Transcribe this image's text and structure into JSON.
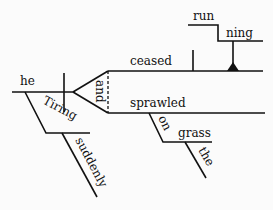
{
  "diagram": {
    "type": "sentence-diagram",
    "sentence": "Tiring suddenly, he ceased running and sprawled on the grass.",
    "words": {
      "subject": "he",
      "participle": "Tiring",
      "participle_modifier": "suddenly",
      "conjunction": "and",
      "verb1": "ceased",
      "gerund_part1": "run",
      "gerund_part2": "ning",
      "verb2": "sprawled",
      "preposition": "on",
      "prep_object": "grass",
      "article": "the"
    },
    "colors": {
      "line": "#111111",
      "background": "#fbfbfb"
    }
  }
}
